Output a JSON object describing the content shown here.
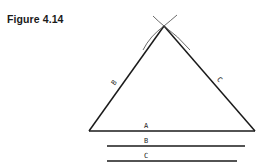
{
  "figure": {
    "title": "Figure 4.14"
  },
  "diagram": {
    "triangle_side_labels": {
      "base": "A",
      "left": "B",
      "right": "C"
    },
    "given_lines": [
      {
        "label": "A"
      },
      {
        "label": "B"
      },
      {
        "label": "C"
      }
    ],
    "stroke_color": "#1a1a1a",
    "arc_color": "#444444",
    "background": "#ffffff"
  }
}
